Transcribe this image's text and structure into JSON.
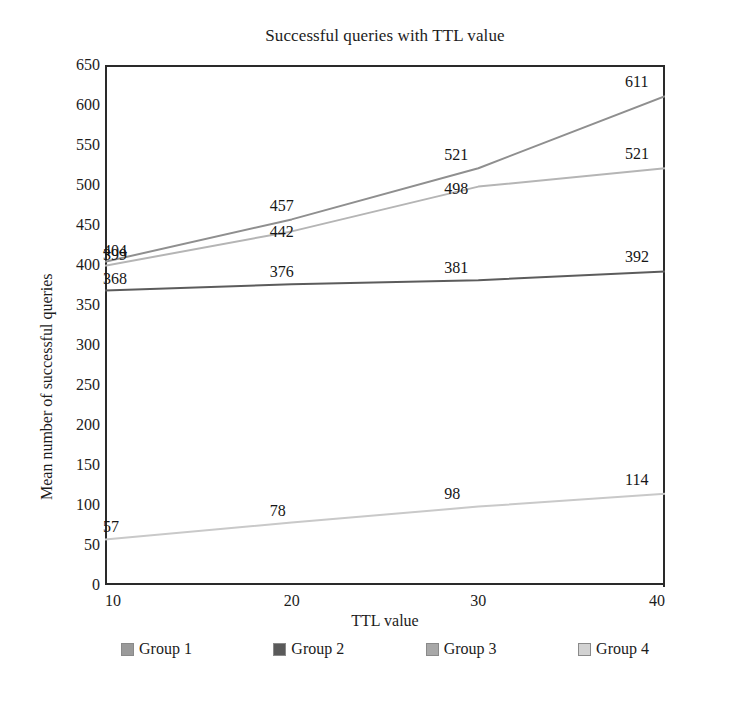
{
  "chart_data": {
    "type": "line",
    "title": "Successful queries with TTL value",
    "xlabel": "TTL value",
    "ylabel": "Mean number of successful queries",
    "x": [
      10,
      20,
      30,
      40
    ],
    "xlim": [
      10,
      40
    ],
    "ylim": [
      0,
      650
    ],
    "xticks": [
      "10",
      "20",
      "30",
      "40"
    ],
    "yticks": [
      "0",
      "50",
      "100",
      "150",
      "200",
      "250",
      "300",
      "350",
      "400",
      "450",
      "500",
      "550",
      "600",
      "650"
    ],
    "grid": false,
    "legend_position": "bottom",
    "series": [
      {
        "name": "Group 1",
        "color": "#8f8f8f",
        "values": [
          404,
          457,
          521,
          611
        ],
        "labels": [
          "404",
          "457",
          "521",
          "611"
        ]
      },
      {
        "name": "Group 2",
        "color": "#5c5c5c",
        "values": [
          368,
          376,
          381,
          392
        ],
        "labels": [
          "368",
          "376",
          "381",
          "392"
        ]
      },
      {
        "name": "Group 3",
        "color": "#b5b5b5",
        "values": [
          399,
          442,
          498,
          521
        ],
        "labels": [
          "399",
          "442",
          "498",
          "521"
        ]
      },
      {
        "name": "Group 4",
        "color": "#c9c9c9",
        "values": [
          57,
          78,
          98,
          114
        ],
        "labels": [
          "57",
          "78",
          "98",
          "114"
        ]
      }
    ]
  },
  "legend": {
    "items": [
      {
        "label": "Group 1",
        "color": "#9a9a9a"
      },
      {
        "label": "Group 2",
        "color": "#5a5a5a"
      },
      {
        "label": "Group 3",
        "color": "#a8a8a8"
      },
      {
        "label": "Group 4",
        "color": "#d2d2d2"
      }
    ]
  },
  "caption": {
    "text": ""
  }
}
